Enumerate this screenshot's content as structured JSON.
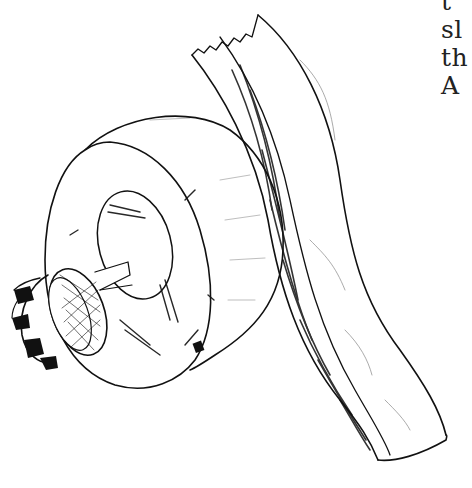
{
  "page": {
    "background": "#ffffff",
    "ink_color": "#111111"
  },
  "text_fragments": {
    "lines": [
      "t",
      "sl",
      "th",
      "A"
    ]
  },
  "illustration": {
    "subject": "wood-blank-on-lathe-chuck",
    "parts": [
      "knurled-chuck",
      "cylindrical-wood-blank",
      "curved-wood-strip"
    ]
  }
}
